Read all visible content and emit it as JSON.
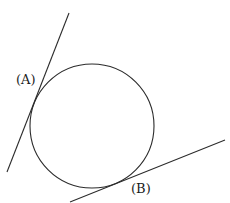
{
  "diagram": {
    "labels": {
      "a": "(A)",
      "b": "(B)"
    },
    "elements": [
      "circle",
      "tangent line A",
      "tangent line B"
    ],
    "colors": {
      "stroke": "#2b2b2b",
      "background": "#ffffff"
    }
  }
}
